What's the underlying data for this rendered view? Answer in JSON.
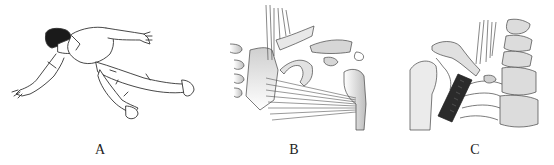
{
  "figure": {
    "panels": [
      {
        "id": "A",
        "label": "A",
        "description": "person-falling-outstretched-arm"
      },
      {
        "id": "B",
        "label": "B",
        "description": "shoulder-girdle-anatomy-with-muscles"
      },
      {
        "id": "C",
        "label": "C",
        "description": "shoulder-and-cervical-spine-with-dark-bar"
      }
    ]
  },
  "colors": {
    "background": "#ffffff",
    "line": "#333333",
    "bone_fill": "#e6e6e6",
    "shade": "#bdbdbd",
    "dark_bar": "#2b2b2b",
    "hair": "#1a1a1a"
  }
}
